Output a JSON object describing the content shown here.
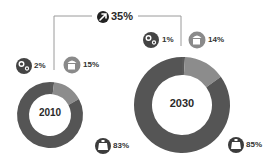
{
  "header": {
    "growth_label": "35%",
    "growth_icon": "arrow-up-right-circle-icon"
  },
  "charts": [
    {
      "year": "2010",
      "segments": [
        {
          "name": "gears",
          "icon": "gears-icon",
          "label": "2%",
          "value": 2,
          "color": "#5a5a5a"
        },
        {
          "name": "cup",
          "icon": "cup-icon",
          "label": "15%",
          "value": 15,
          "color": "#8c8c8c"
        },
        {
          "name": "jar",
          "icon": "jar-icon",
          "label": "83%",
          "value": 83,
          "color": "#555555"
        }
      ]
    },
    {
      "year": "2030",
      "segments": [
        {
          "name": "gears",
          "icon": "gears-icon",
          "label": "1%",
          "value": 1,
          "color": "#5a5a5a"
        },
        {
          "name": "cup",
          "icon": "cup-icon",
          "label": "14%",
          "value": 14,
          "color": "#8c8c8c"
        },
        {
          "name": "jar",
          "icon": "jar-icon",
          "label": "85%",
          "value": 85,
          "color": "#555555"
        }
      ]
    }
  ],
  "chart_data": [
    {
      "type": "pie",
      "title": "2010",
      "categories": [
        "gears",
        "cup",
        "jar"
      ],
      "values": [
        2,
        15,
        83
      ],
      "labels": [
        "2%",
        "15%",
        "83%"
      ]
    },
    {
      "type": "pie",
      "title": "2030",
      "categories": [
        "gears",
        "cup",
        "jar"
      ],
      "values": [
        1,
        14,
        85
      ],
      "labels": [
        "1%",
        "14%",
        "85%"
      ],
      "annotation": "35%"
    }
  ],
  "colors": {
    "dark": "#555555",
    "medium": "#8c8c8c",
    "icon_dark": "#3a3a3a",
    "icon_medium": "#888888",
    "line": "#999999"
  }
}
